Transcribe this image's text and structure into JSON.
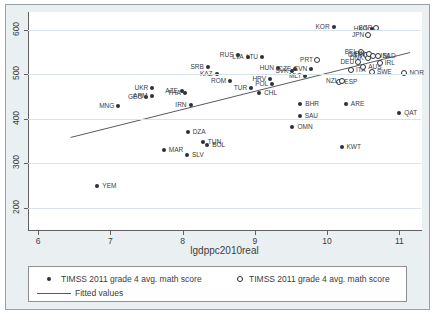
{
  "chart_data": {
    "type": "scatter",
    "title": "",
    "xlabel": "lgdppc2010real",
    "ylabel": "",
    "x_ticks": [
      6,
      7,
      8,
      9,
      10,
      11
    ],
    "y_ticks": [
      200,
      300,
      400,
      500,
      600
    ],
    "x_range": [
      5.86,
      11.3
    ],
    "y_range": [
      150,
      640
    ],
    "grid": "horizontal-only",
    "legend_position": "bottom",
    "series": [
      {
        "name": "TIMSS 2011 grade 4 avg. math score",
        "marker": "filled",
        "points": [
          {
            "code": "YEM",
            "x": 6.82,
            "y": 248,
            "side": "right"
          },
          {
            "code": "MNG",
            "x": 7.11,
            "y": 429,
            "side": "left"
          },
          {
            "code": "GEO",
            "x": 7.5,
            "y": 450,
            "side": "left"
          },
          {
            "code": "ARM",
            "x": 7.57,
            "y": 452,
            "side": "left"
          },
          {
            "code": "UKR",
            "x": 7.58,
            "y": 469,
            "side": "left"
          },
          {
            "code": "MAR",
            "x": 7.74,
            "y": 330,
            "side": "right"
          },
          {
            "code": "AZE",
            "x": 7.99,
            "y": 463,
            "side": "left"
          },
          {
            "code": "THA",
            "x": 8.03,
            "y": 458,
            "side": "left"
          },
          {
            "code": "SLV",
            "x": 8.06,
            "y": 318,
            "side": "right"
          },
          {
            "code": "DZA",
            "x": 8.07,
            "y": 371,
            "side": "right"
          },
          {
            "code": "IRN",
            "x": 8.11,
            "y": 431,
            "side": "left"
          },
          {
            "code": "TUN",
            "x": 8.28,
            "y": 347,
            "side": "right"
          },
          {
            "code": "BOL",
            "x": 8.34,
            "y": 341,
            "side": "right"
          },
          {
            "code": "SRB",
            "x": 8.35,
            "y": 516,
            "side": "left"
          },
          {
            "code": "KAZ",
            "x": 8.47,
            "y": 501,
            "side": "left"
          },
          {
            "code": "ROM",
            "x": 8.66,
            "y": 486,
            "side": "left"
          },
          {
            "code": "RUS",
            "x": 8.76,
            "y": 544,
            "side": "left"
          },
          {
            "code": "LVA",
            "x": 8.9,
            "y": 539,
            "side": "left"
          },
          {
            "code": "TUR",
            "x": 8.95,
            "y": 469,
            "side": "left"
          },
          {
            "code": "CHL",
            "x": 9.06,
            "y": 459,
            "side": "right"
          },
          {
            "code": "LTU",
            "x": 9.1,
            "y": 538,
            "side": "left"
          },
          {
            "code": "HRV",
            "x": 9.21,
            "y": 490,
            "side": "left"
          },
          {
            "code": "POL",
            "x": 9.24,
            "y": 478,
            "side": "left"
          },
          {
            "code": "HUN",
            "x": 9.32,
            "y": 515,
            "side": "left"
          },
          {
            "code": "OMN",
            "x": 9.52,
            "y": 381,
            "side": "right"
          },
          {
            "code": "SVK",
            "x": 9.52,
            "y": 507,
            "side": "left"
          },
          {
            "code": "CZE",
            "x": 9.56,
            "y": 511,
            "side": "left"
          },
          {
            "code": "SAU",
            "x": 9.62,
            "y": 407,
            "side": "right"
          },
          {
            "code": "BHR",
            "x": 9.63,
            "y": 434,
            "side": "right"
          },
          {
            "code": "MLT",
            "x": 9.7,
            "y": 496,
            "side": "left"
          },
          {
            "code": "SVN",
            "x": 9.78,
            "y": 513,
            "side": "left"
          },
          {
            "code": "KOR",
            "x": 10.09,
            "y": 607,
            "side": "left"
          },
          {
            "code": "KWT",
            "x": 10.2,
            "y": 337,
            "side": "right"
          },
          {
            "code": "ARE",
            "x": 10.26,
            "y": 433,
            "side": "right"
          },
          {
            "code": "HKG",
            "x": 10.62,
            "y": 602,
            "side": "left"
          },
          {
            "code": "QAT",
            "x": 11.0,
            "y": 414,
            "side": "right"
          }
        ]
      },
      {
        "name": "TIMSS 2011 grade 4 avg. math score",
        "marker": "hollow",
        "points": [
          {
            "code": "PRT",
            "x": 9.86,
            "y": 532,
            "side": "left"
          },
          {
            "code": "ESP",
            "x": 10.17,
            "y": 483,
            "side": "right"
          },
          {
            "code": "NZL",
            "x": 10.21,
            "y": 486,
            "side": "left"
          },
          {
            "code": "ITA",
            "x": 10.33,
            "y": 509,
            "side": "right"
          },
          {
            "code": "DEU",
            "x": 10.43,
            "y": 528,
            "side": "left"
          },
          {
            "code": "BEL",
            "x": 10.47,
            "y": 549,
            "side": "left"
          },
          {
            "code": "AUS",
            "x": 10.5,
            "y": 517,
            "side": "right"
          },
          {
            "code": "GBR",
            "x": 10.54,
            "y": 543,
            "side": "left"
          },
          {
            "code": "DNK",
            "x": 10.56,
            "y": 537,
            "side": "left"
          },
          {
            "code": "JPN",
            "x": 10.57,
            "y": 588,
            "side": "left"
          },
          {
            "code": "FIN",
            "x": 10.58,
            "y": 546,
            "side": "left"
          },
          {
            "code": "SWE",
            "x": 10.62,
            "y": 505,
            "side": "right"
          },
          {
            "code": "USA",
            "x": 10.63,
            "y": 541,
            "side": "right"
          },
          {
            "code": "SGP",
            "x": 10.68,
            "y": 604,
            "side": "left"
          },
          {
            "code": "NLD",
            "x": 10.7,
            "y": 540,
            "side": "right"
          },
          {
            "code": "IRL",
            "x": 10.73,
            "y": 526,
            "side": "right"
          },
          {
            "code": "NOR",
            "x": 11.07,
            "y": 504,
            "side": "right"
          }
        ]
      }
    ],
    "fitted_line": {
      "name": "Fitted values",
      "x1": 6.45,
      "y1": 358,
      "x2": 11.15,
      "y2": 549
    }
  },
  "legend": {
    "items": [
      {
        "marker": "filled",
        "label": "TIMSS 2011 grade 4 avg. math score"
      },
      {
        "marker": "hollow",
        "label": "TIMSS 2011 grade 4 avg. math score"
      },
      {
        "marker": "line",
        "label": "Fitted values"
      }
    ]
  },
  "colors": {
    "background": "#eaeff1",
    "plot_background": "#ffffff",
    "gridline": "#d6e4e7",
    "marker": "#2f2f3a",
    "fitted_line": "#5a5a66",
    "text": "#3d3d3d"
  }
}
